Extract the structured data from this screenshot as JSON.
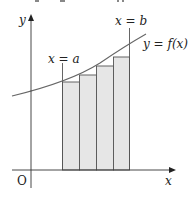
{
  "diagram": {
    "type": "riemann-sum",
    "labels": {
      "y_axis": "y",
      "x_axis": "x",
      "origin": "O",
      "left_bound": "x = a",
      "right_bound": "x = b",
      "curve": "y = f(x)"
    },
    "rectangles": 4,
    "colors": {
      "rect_fill": "#e6e6e6",
      "stroke": "#555555",
      "curve": "#666666"
    }
  }
}
